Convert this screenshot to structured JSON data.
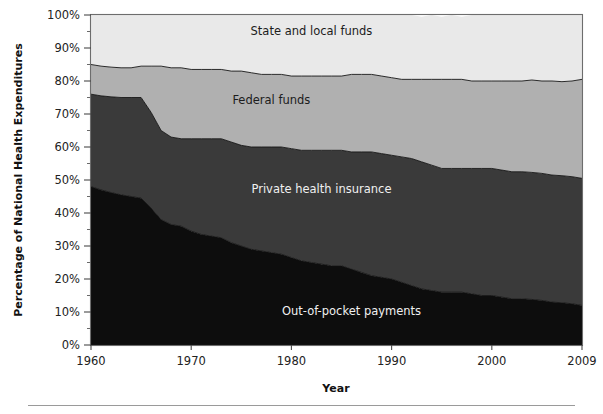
{
  "chart_data": {
    "type": "area",
    "title": "",
    "xlabel": "Year",
    "ylabel": "Percentage of National Health Expenditures",
    "xlim": [
      1960,
      2009
    ],
    "ylim": [
      0,
      100
    ],
    "grid": false,
    "stacked": true,
    "legend": "in-plot-labels",
    "xtick_labels": [
      "1960",
      "1970",
      "1980",
      "1990",
      "2000",
      "2009"
    ],
    "xticks": [
      1960,
      1970,
      1980,
      1990,
      2000,
      2009
    ],
    "ytick_labels": [
      "0%",
      "10%",
      "20%",
      "30%",
      "40%",
      "50%",
      "60%",
      "70%",
      "80%",
      "90%",
      "100%"
    ],
    "yticks": [
      0,
      10,
      20,
      30,
      40,
      50,
      60,
      70,
      80,
      90,
      100
    ],
    "yticks_minor": [
      5,
      15,
      25,
      35,
      45,
      55,
      65,
      75,
      85,
      95
    ],
    "x": [
      1960,
      1961,
      1962,
      1963,
      1964,
      1965,
      1966,
      1967,
      1968,
      1969,
      1970,
      1971,
      1972,
      1973,
      1974,
      1975,
      1976,
      1977,
      1978,
      1979,
      1980,
      1981,
      1982,
      1983,
      1984,
      1985,
      1986,
      1987,
      1988,
      1989,
      1990,
      1991,
      1992,
      1993,
      1994,
      1995,
      1996,
      1997,
      1998,
      1999,
      2000,
      2001,
      2002,
      2003,
      2004,
      2005,
      2006,
      2007,
      2008,
      2009
    ],
    "series": [
      {
        "name": "Out-of-pocket payments",
        "color": "#0d0d0d",
        "label_x": 1986,
        "label_y": 9,
        "label_color": "light",
        "values": [
          48.0,
          47.0,
          46.2,
          45.5,
          45.0,
          44.5,
          41.5,
          38.0,
          36.5,
          36.0,
          34.5,
          33.5,
          33.0,
          32.5,
          31.0,
          30.0,
          29.0,
          28.5,
          28.0,
          27.5,
          26.5,
          25.5,
          25.0,
          24.5,
          24.0,
          24.0,
          23.0,
          22.0,
          21.0,
          20.5,
          20.0,
          19.0,
          18.0,
          17.0,
          16.5,
          16.0,
          16.0,
          16.0,
          15.5,
          15.0,
          15.0,
          14.5,
          14.0,
          14.0,
          13.8,
          13.5,
          13.0,
          12.8,
          12.5,
          12.0
        ]
      },
      {
        "name": "Private health insurance",
        "color": "#3a3a3a",
        "label_x": 1983,
        "label_y": 46,
        "label_color": "light",
        "values": [
          28.0,
          28.5,
          29.0,
          29.5,
          30.0,
          30.5,
          29.0,
          27.0,
          26.5,
          26.5,
          28.0,
          29.0,
          29.5,
          30.0,
          30.5,
          30.5,
          31.0,
          31.5,
          32.0,
          32.5,
          33.0,
          33.5,
          34.0,
          34.5,
          35.0,
          35.0,
          35.5,
          36.5,
          37.5,
          37.5,
          37.5,
          38.0,
          38.5,
          38.5,
          38.0,
          37.5,
          37.5,
          37.5,
          38.0,
          38.5,
          38.5,
          38.5,
          38.5,
          38.5,
          38.5,
          38.5,
          38.5,
          38.5,
          38.5,
          38.5
        ]
      },
      {
        "name": "Federal funds",
        "color": "#b0b0b0",
        "label_x": 1978,
        "label_y": 73,
        "label_color": "dark",
        "values": [
          9.0,
          9.0,
          9.0,
          9.0,
          9.0,
          9.5,
          14.0,
          19.5,
          21.0,
          21.5,
          21.0,
          21.0,
          21.0,
          21.0,
          21.5,
          22.5,
          22.5,
          22.0,
          22.0,
          22.0,
          22.0,
          22.5,
          22.5,
          22.5,
          22.5,
          22.5,
          23.5,
          23.5,
          23.5,
          23.5,
          23.5,
          23.5,
          24.0,
          25.0,
          26.0,
          27.0,
          27.0,
          27.0,
          26.5,
          26.5,
          26.5,
          27.0,
          27.5,
          27.5,
          28.0,
          28.0,
          28.5,
          28.5,
          29.0,
          30.0
        ]
      },
      {
        "name": "State and local funds",
        "color": "#e9e9e9",
        "label_x": 1982,
        "label_y": 94,
        "label_color": "dark",
        "values": [
          15.0,
          15.5,
          15.8,
          16.0,
          16.0,
          15.5,
          15.5,
          15.5,
          16.0,
          16.0,
          16.5,
          16.5,
          16.5,
          16.5,
          17.0,
          17.0,
          17.5,
          18.0,
          18.0,
          18.0,
          18.5,
          18.5,
          18.5,
          18.5,
          18.5,
          18.5,
          18.0,
          18.0,
          18.0,
          18.5,
          19.0,
          19.5,
          19.5,
          19.0,
          19.5,
          19.0,
          19.5,
          19.0,
          20.0,
          20.0,
          20.0,
          20.0,
          20.0,
          20.0,
          19.7,
          20.0,
          20.0,
          20.2,
          20.0,
          19.5
        ]
      }
    ]
  }
}
